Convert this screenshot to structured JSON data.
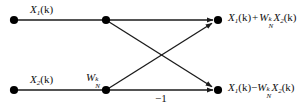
{
  "diagram": {
    "stroke_color": "#1a1a1a",
    "node_color": "#000000",
    "background": "#ffffff"
  },
  "nodes": [
    {
      "name": "input-top-node",
      "x": 14,
      "y": 20
    },
    {
      "name": "mid-top-node",
      "x": 106,
      "y": 20
    },
    {
      "name": "output-top-node",
      "x": 218,
      "y": 20
    },
    {
      "name": "input-bottom-node",
      "x": 14,
      "y": 90
    },
    {
      "name": "mid-bottom-node",
      "x": 106,
      "y": 90
    },
    {
      "name": "output-bottom-node",
      "x": 218,
      "y": 90
    }
  ],
  "edges": [
    {
      "name": "top-input-branch",
      "from": [
        14,
        20
      ],
      "to": [
        106,
        20
      ],
      "arrow": false
    },
    {
      "name": "top-straight-branch",
      "from": [
        106,
        20
      ],
      "to": [
        218,
        20
      ],
      "arrow": true
    },
    {
      "name": "bottom-input-branch",
      "from": [
        14,
        90
      ],
      "to": [
        106,
        90
      ],
      "arrow": false
    },
    {
      "name": "bottom-straight-branch",
      "from": [
        106,
        90
      ],
      "to": [
        218,
        90
      ],
      "arrow": true
    },
    {
      "name": "cross-down-branch",
      "from": [
        106,
        20
      ],
      "to": [
        218,
        90
      ],
      "arrow": true
    },
    {
      "name": "cross-up-branch",
      "from": [
        106,
        90
      ],
      "to": [
        218,
        20
      ],
      "arrow": true
    }
  ],
  "labels": {
    "input_top": {
      "base": "X",
      "sub": "1",
      "arg": "(k)"
    },
    "input_bottom": {
      "base": "X",
      "sub": "2",
      "arg": "(k)"
    },
    "weight": {
      "base": "W",
      "sub": "N",
      "sup": "k"
    },
    "minus_one": "−1",
    "output_top": {
      "text": "X1(k) + WNk X2(k)",
      "term1_base": "X",
      "term1_sub": "1",
      "term1_arg": "(k)",
      "operator": "+",
      "weight_base": "W",
      "weight_sub": "N",
      "weight_sup": "k",
      "term2_base": "X",
      "term2_sub": "2",
      "term2_arg": "(k)"
    },
    "output_bottom": {
      "text": "X1(k) − WNk X2(k)",
      "term1_base": "X",
      "term1_sub": "1",
      "term1_arg": "(k)",
      "operator": "−",
      "weight_base": "W",
      "weight_sub": "N",
      "weight_sup": "k",
      "term2_base": "X",
      "term2_sub": "2",
      "term2_arg": "(k)"
    }
  }
}
